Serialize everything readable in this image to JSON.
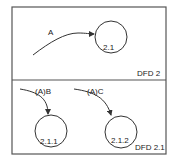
{
  "diagram": {
    "top_panel": {
      "title": "DFD 2",
      "flow": {
        "label": "A"
      },
      "process": {
        "label": "2.1"
      }
    },
    "bottom_panel": {
      "title": "DFD 2.1",
      "flows": [
        {
          "label": "(A)B"
        },
        {
          "label": "(A)C"
        }
      ],
      "processes": [
        {
          "label": "2.1.1"
        },
        {
          "label": "2.1.2"
        }
      ]
    },
    "colors": {
      "line": "#333333",
      "frame": "#555555",
      "background": "#ffffff"
    }
  }
}
